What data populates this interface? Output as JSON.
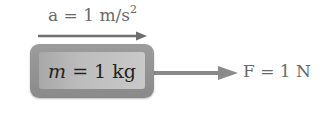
{
  "acceleration": {
    "prefix": "a = 1 m/s",
    "exponent": "2"
  },
  "mass": {
    "symbol": "m",
    "rest": " = 1 kg"
  },
  "force": {
    "label": "F = 1 N"
  },
  "colors": {
    "arrow": "#7a7a7a",
    "box_outer": "#939393",
    "box_inner": "#bdbdbd",
    "text": "#6a6a6a"
  }
}
